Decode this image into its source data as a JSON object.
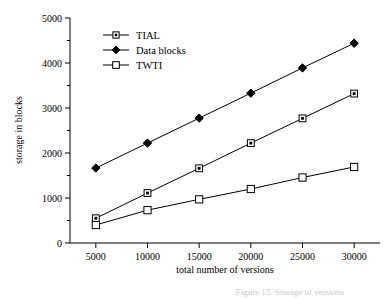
{
  "chart_data": {
    "type": "line",
    "title": "",
    "xlabel": "total number of versions",
    "ylabel": "storage in blocks",
    "x": [
      5000,
      10000,
      15000,
      20000,
      25000,
      30000
    ],
    "xticklabels": [
      "5000",
      "10000",
      "15000",
      "20000",
      "25000",
      "30000"
    ],
    "yticklabels": [
      "0",
      "1000",
      "2000",
      "3000",
      "4000",
      "5000"
    ],
    "ytickvalues": [
      0,
      1000,
      2000,
      3000,
      4000,
      5000
    ],
    "yminorvalues": [
      500,
      1500,
      2500,
      3500,
      4500
    ],
    "xlim": [
      2500,
      32500
    ],
    "ylim": [
      0,
      5000
    ],
    "grid": false,
    "legend_position": "upper-left",
    "series": [
      {
        "name": "TIAL",
        "marker": "square-dot",
        "values": [
          550,
          1110,
          1660,
          2220,
          2770,
          3320
        ]
      },
      {
        "name": "Data blocks",
        "marker": "diamond-filled",
        "values": [
          1665,
          2220,
          2775,
          3330,
          3890,
          4440
        ]
      },
      {
        "name": "TWTI",
        "marker": "square-open",
        "values": [
          400,
          730,
          970,
          1200,
          1455,
          1690
        ]
      }
    ]
  },
  "legend": {
    "items": [
      {
        "label": "TIAL",
        "marker": "square-dot"
      },
      {
        "label": "Data blocks",
        "marker": "diamond-filled"
      },
      {
        "label": "TWTI",
        "marker": "square-open"
      }
    ]
  },
  "axes": {
    "x_title": "total number of versions",
    "y_title": "storage in blocks"
  },
  "caption": {
    "text": "Figure 15. Storage of versions"
  },
  "colors": {
    "ink": "#000000",
    "background": "#ffffff",
    "caption": "#c9c9c9"
  }
}
